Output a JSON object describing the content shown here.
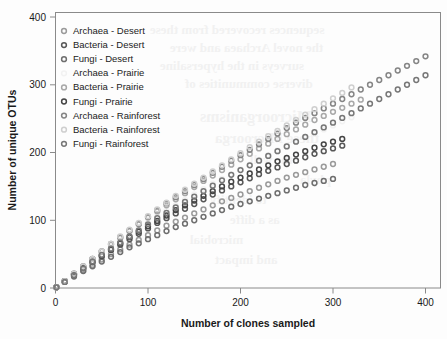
{
  "chart_data": {
    "type": "scatter",
    "title": "",
    "xlabel": "Number of clones sampled",
    "ylabel": "Number of unique OTUs",
    "xlim": [
      0,
      440
    ],
    "ylim": [
      0,
      420
    ],
    "xticks": [
      0,
      100,
      200,
      300,
      400
    ],
    "yticks": [
      0,
      100,
      200,
      300,
      400
    ],
    "grid": false,
    "legend_position": "top-left",
    "marker": "open-circle",
    "series": [
      {
        "name": "Archaea - Desert",
        "color": "#9a9a9a",
        "legend_label": "Archaea - Desert",
        "x": [
          1,
          10,
          20,
          30,
          40,
          50,
          60,
          70,
          80,
          90,
          100,
          110,
          120,
          130,
          140,
          150,
          160,
          170,
          180,
          190,
          200,
          210,
          220,
          230,
          240,
          250,
          260,
          270,
          280,
          290,
          300
        ],
        "y": [
          1,
          9,
          18,
          26,
          34,
          42,
          50,
          57,
          64,
          71,
          78,
          85,
          92,
          98,
          104,
          110,
          116,
          122,
          128,
          133,
          138,
          143,
          148,
          153,
          158,
          163,
          167,
          171,
          175,
          179,
          183
        ]
      },
      {
        "name": "Bacteria - Desert",
        "color": "#575757",
        "legend_label": "Bacteria - Desert",
        "x": [
          1,
          10,
          20,
          30,
          40,
          50,
          60,
          70,
          80,
          90,
          100,
          110,
          120,
          130,
          140,
          150,
          160,
          170,
          180,
          190,
          200,
          210,
          220,
          230,
          240,
          250,
          260,
          270,
          280,
          290,
          300,
          310
        ],
        "y": [
          1,
          10,
          20,
          29,
          38,
          47,
          56,
          64,
          72,
          80,
          88,
          96,
          103,
          110,
          117,
          124,
          131,
          138,
          144,
          150,
          156,
          162,
          168,
          173,
          178,
          183,
          188,
          193,
          198,
          202,
          206,
          210
        ]
      },
      {
        "name": "Fungi - Desert",
        "color": "#6e6e6e",
        "legend_label": "Fungi - Desert",
        "x": [
          1,
          10,
          20,
          30,
          40,
          50,
          60,
          70,
          80,
          90,
          100,
          110,
          120,
          130,
          140,
          150,
          160,
          170,
          180,
          190,
          200,
          210,
          220,
          230,
          240,
          250,
          260,
          270,
          280,
          290,
          300
        ],
        "y": [
          1,
          9,
          17,
          25,
          32,
          39,
          46,
          53,
          60,
          66,
          72,
          78,
          84,
          90,
          95,
          100,
          105,
          110,
          115,
          120,
          124,
          128,
          132,
          136,
          140,
          144,
          148,
          152,
          155,
          158,
          161
        ]
      },
      {
        "name": "Archaea - Prairie",
        "color": "#f2f2f2",
        "legend_label": "Archaea - Prairie",
        "x": [
          1,
          10,
          20,
          30,
          40,
          50,
          60,
          70,
          80,
          90,
          100,
          110,
          120,
          130,
          140,
          150,
          160,
          170,
          180,
          190,
          200,
          210,
          220,
          230,
          240,
          250,
          260,
          270,
          280,
          290,
          300,
          310,
          320
        ],
        "y": [
          1,
          10,
          21,
          31,
          41,
          51,
          61,
          70,
          79,
          88,
          97,
          106,
          114,
          122,
          130,
          138,
          146,
          154,
          161,
          168,
          175,
          182,
          189,
          196,
          203,
          210,
          216,
          222,
          228,
          234,
          240,
          246,
          252
        ]
      },
      {
        "name": "Bacteria - Prairie",
        "color": "#a8a8a8",
        "legend_label": "Bacteria - Prairie",
        "x": [
          1,
          10,
          20,
          30,
          40,
          50,
          60,
          70,
          80,
          90,
          100,
          110,
          120,
          130,
          140,
          150,
          160,
          170,
          180,
          190,
          200,
          210,
          220,
          230,
          240,
          250,
          260,
          270,
          280,
          290,
          300,
          310,
          320,
          330
        ],
        "y": [
          1,
          10,
          21,
          32,
          43,
          54,
          64,
          74,
          84,
          94,
          104,
          113,
          122,
          131,
          140,
          149,
          158,
          166,
          174,
          182,
          190,
          198,
          206,
          213,
          220,
          227,
          234,
          241,
          248,
          254,
          260,
          266,
          272,
          278
        ]
      },
      {
        "name": "Fungi - Prairie",
        "color": "#454545",
        "legend_label": "Fungi - Prairie",
        "x": [
          1,
          10,
          20,
          30,
          40,
          50,
          60,
          70,
          80,
          90,
          100,
          110,
          120,
          130,
          140,
          150,
          160,
          170,
          180,
          190,
          200,
          210,
          220,
          230,
          240,
          250,
          260,
          270,
          280,
          290,
          300,
          310
        ],
        "y": [
          1,
          10,
          20,
          30,
          39,
          48,
          57,
          66,
          75,
          83,
          91,
          99,
          107,
          115,
          122,
          129,
          136,
          143,
          150,
          157,
          163,
          169,
          175,
          181,
          187,
          192,
          197,
          202,
          207,
          212,
          216,
          220
        ]
      },
      {
        "name": "Archaea - Rainforest",
        "color": "#858585",
        "legend_label": "Archaea - Rainforest",
        "x": [
          1,
          10,
          20,
          30,
          40,
          50,
          60,
          70,
          80,
          90,
          100,
          110,
          120,
          130,
          140,
          150,
          160,
          170,
          180,
          190,
          200,
          210,
          220,
          230,
          240,
          250,
          260,
          270,
          280,
          290,
          300,
          310,
          320,
          330,
          340,
          350,
          360,
          370,
          380,
          390,
          400
        ],
        "y": [
          1,
          10,
          21,
          32,
          43,
          54,
          65,
          75,
          85,
          95,
          105,
          115,
          125,
          134,
          143,
          152,
          161,
          170,
          179,
          188,
          196,
          204,
          212,
          220,
          228,
          236,
          244,
          251,
          258,
          265,
          272,
          279,
          286,
          293,
          300,
          307,
          314,
          321,
          328,
          335,
          342
        ]
      },
      {
        "name": "Bacteria - Rainforest",
        "color": "#cfcfcf",
        "legend_label": "Bacteria - Rainforest",
        "x": [
          1,
          10,
          20,
          30,
          40,
          50,
          60,
          70,
          80,
          90,
          100,
          110,
          120,
          130,
          140,
          150,
          160,
          170,
          180,
          190,
          200,
          210,
          220,
          230,
          240,
          250,
          260,
          270,
          280,
          290,
          300,
          310,
          320
        ],
        "y": [
          1,
          10,
          21,
          32,
          43,
          54,
          65,
          76,
          86,
          96,
          106,
          116,
          126,
          136,
          145,
          154,
          163,
          172,
          181,
          190,
          199,
          208,
          216,
          224,
          232,
          240,
          248,
          256,
          264,
          272,
          280,
          288,
          296
        ]
      },
      {
        "name": "Fungi - Rainforest",
        "color": "#777777",
        "legend_label": "Fungi - Rainforest",
        "x": [
          1,
          10,
          20,
          30,
          40,
          50,
          60,
          70,
          80,
          90,
          100,
          110,
          120,
          130,
          140,
          150,
          160,
          170,
          180,
          190,
          200,
          210,
          220,
          230,
          240,
          250,
          260,
          270,
          280,
          290,
          300,
          310,
          320,
          330,
          340,
          350,
          360,
          370,
          380,
          390,
          400
        ],
        "y": [
          1,
          9,
          19,
          29,
          39,
          49,
          58,
          67,
          76,
          85,
          94,
          103,
          111,
          119,
          127,
          135,
          143,
          151,
          159,
          167,
          174,
          181,
          188,
          195,
          202,
          209,
          216,
          223,
          230,
          237,
          244,
          251,
          258,
          265,
          272,
          279,
          286,
          293,
          300,
          307,
          314
        ]
      }
    ]
  },
  "axes": {
    "x_label": "Number of clones sampled",
    "y_label": "Number of unique OTUs",
    "x_tick_labels": [
      "0",
      "100",
      "200",
      "300",
      "400"
    ],
    "y_tick_labels": [
      "0",
      "100",
      "200",
      "300",
      "400"
    ]
  },
  "legend": {
    "items": [
      "Archaea - Desert",
      "Bacteria - Desert",
      "Fungi - Desert",
      "Archaea - Prairie",
      "Bacteria - Prairie",
      "Fungi - Prairie",
      "Archaea - Rainforest",
      "Bacteria - Rainforest",
      "Fungi - Rainforest"
    ]
  },
  "ghost_text": {
    "lines": [
      "sequences recovered from these",
      "the novel Archaea and were",
      "surveys in the hypersaline",
      "diverse communities of",
      "Microorganisms",
      "these Microorga",
      "the well",
      "phyla",
      "to identify",
      "as a diffe",
      "microbial",
      "and impact"
    ]
  }
}
